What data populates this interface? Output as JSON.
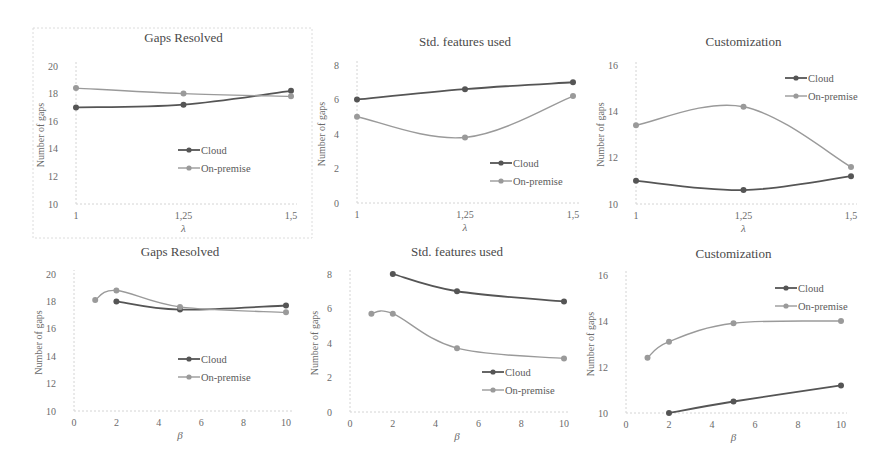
{
  "chart_data": [
    {
      "type": "line",
      "title": "Gaps Resolved",
      "xlabel": "λ",
      "ylabel": "Number of gaps",
      "x": [
        1,
        1.25,
        1.5
      ],
      "x_tick_labels": [
        "1",
        "1,25",
        "1,5"
      ],
      "xlim": [
        1,
        1.5
      ],
      "ylim": [
        10,
        20
      ],
      "y_ticks": [
        10,
        12,
        14,
        16,
        18,
        20
      ],
      "grid": false,
      "legend_position": "center",
      "framed": true,
      "series": [
        {
          "name": "Cloud",
          "x": [
            1,
            1.25,
            1.5
          ],
          "values": [
            17.0,
            17.2,
            18.2
          ],
          "color": "#555555"
        },
        {
          "name": "On-premise",
          "x": [
            1,
            1.25,
            1.5
          ],
          "values": [
            18.4,
            18.0,
            17.8
          ],
          "color": "#9a9a9a"
        }
      ]
    },
    {
      "type": "line",
      "title": "Std. features used",
      "xlabel": "λ",
      "ylabel": "Number of gaps",
      "x": [
        1,
        1.25,
        1.5
      ],
      "x_tick_labels": [
        "1",
        "1,25",
        "1,5"
      ],
      "xlim": [
        1,
        1.5
      ],
      "ylim": [
        0,
        8
      ],
      "y_ticks": [
        0,
        2,
        4,
        6,
        8
      ],
      "grid": false,
      "legend_position": "lower right",
      "series": [
        {
          "name": "Cloud",
          "x": [
            1,
            1.25,
            1.5
          ],
          "values": [
            6.0,
            6.6,
            7.0
          ],
          "color": "#555555"
        },
        {
          "name": "On-premise",
          "x": [
            1,
            1.25,
            1.5
          ],
          "values": [
            5.0,
            3.8,
            6.2
          ],
          "color": "#9a9a9a"
        }
      ]
    },
    {
      "type": "line",
      "title": "Customization",
      "xlabel": "λ",
      "ylabel": "Number of gaps",
      "x": [
        1,
        1.25,
        1.5
      ],
      "x_tick_labels": [
        "1",
        "1,25",
        "1,5"
      ],
      "xlim": [
        1,
        1.5
      ],
      "ylim": [
        10,
        16
      ],
      "y_ticks": [
        10,
        12,
        14,
        16
      ],
      "grid": false,
      "legend_position": "upper right",
      "series": [
        {
          "name": "Cloud",
          "x": [
            1,
            1.25,
            1.5
          ],
          "values": [
            11.0,
            10.6,
            11.2
          ],
          "color": "#555555"
        },
        {
          "name": "On-premise",
          "x": [
            1,
            1.25,
            1.5
          ],
          "values": [
            13.4,
            14.2,
            11.6
          ],
          "color": "#9a9a9a"
        }
      ]
    },
    {
      "type": "line",
      "title": "Gaps Resolved",
      "xlabel": "β",
      "ylabel": "Number of gaps",
      "x_tick_labels": [
        "0",
        "2",
        "4",
        "6",
        "8",
        "10"
      ],
      "xlim": [
        0,
        10
      ],
      "ylim": [
        10,
        20
      ],
      "y_ticks": [
        10,
        12,
        14,
        16,
        18,
        20
      ],
      "grid": false,
      "legend_position": "center right",
      "series": [
        {
          "name": "Cloud",
          "x": [
            2,
            5,
            10
          ],
          "values": [
            18.0,
            17.4,
            17.7
          ],
          "color": "#555555"
        },
        {
          "name": "On-premise",
          "x": [
            1,
            2,
            5,
            10
          ],
          "values": [
            18.1,
            18.8,
            17.6,
            17.2
          ],
          "color": "#9a9a9a"
        }
      ]
    },
    {
      "type": "line",
      "title": "Std. features used",
      "xlabel": "β",
      "ylabel": "Number of gaps",
      "x_tick_labels": [
        "0",
        "2",
        "4",
        "6",
        "8",
        "10"
      ],
      "xlim": [
        0,
        10
      ],
      "ylim": [
        0,
        8
      ],
      "y_ticks": [
        0,
        2,
        4,
        6,
        8
      ],
      "grid": false,
      "legend_position": "lower right",
      "series": [
        {
          "name": "Cloud",
          "x": [
            2,
            5,
            10
          ],
          "values": [
            8.0,
            7.0,
            6.4
          ],
          "color": "#555555"
        },
        {
          "name": "On-premise",
          "x": [
            1,
            2,
            5,
            10
          ],
          "values": [
            5.7,
            5.7,
            3.7,
            3.1
          ],
          "color": "#9a9a9a"
        }
      ]
    },
    {
      "type": "line",
      "title": "Customization",
      "xlabel": "β",
      "ylabel": "Number of gaps",
      "x_tick_labels": [
        "0",
        "2",
        "4",
        "6",
        "8",
        "10"
      ],
      "xlim": [
        0,
        10
      ],
      "ylim": [
        10,
        16
      ],
      "y_ticks": [
        10,
        12,
        14,
        16
      ],
      "grid": false,
      "legend_position": "upper right",
      "series": [
        {
          "name": "Cloud",
          "x": [
            2,
            5,
            10
          ],
          "values": [
            10.0,
            10.5,
            11.2
          ],
          "color": "#555555"
        },
        {
          "name": "On-premise",
          "x": [
            1,
            2,
            5,
            10
          ],
          "values": [
            12.4,
            13.1,
            13.9,
            14.0
          ],
          "color": "#9a9a9a"
        }
      ]
    }
  ],
  "layout": [
    {
      "px": [
        76,
        291
      ],
      "py": [
        204,
        66
      ],
      "titleY": 42,
      "legend": [
        178,
        150
      ],
      "box": [
        33,
        28,
        312,
        238
      ]
    },
    {
      "px": [
        357,
        573
      ],
      "py": [
        203,
        65
      ],
      "titleY": 46,
      "legend": [
        490,
        163
      ]
    },
    {
      "px": [
        636,
        851
      ],
      "py": [
        204,
        65
      ],
      "titleY": 46,
      "legend": [
        785,
        78
      ]
    },
    {
      "px": [
        74,
        286
      ],
      "py": [
        411,
        274
      ],
      "titleY": 256,
      "legend": [
        178,
        359
      ]
    },
    {
      "px": [
        350,
        564
      ],
      "py": [
        412,
        274
      ],
      "titleY": 256,
      "legend": [
        482,
        372
      ]
    },
    {
      "px": [
        626,
        841
      ],
      "py": [
        413,
        275
      ],
      "titleY": 258,
      "legend": [
        775,
        288
      ]
    }
  ]
}
